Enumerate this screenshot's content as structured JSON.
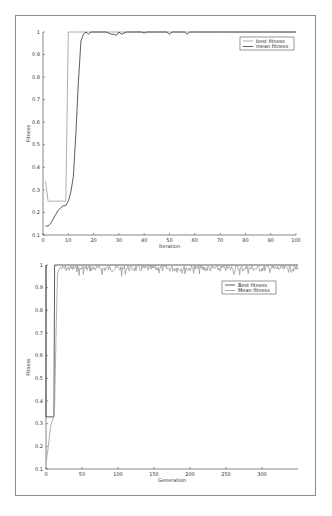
{
  "chart_data": [
    {
      "type": "line",
      "title": "",
      "xlabel": "Iteration",
      "ylabel": "Fitness",
      "xlim": [
        0,
        100
      ],
      "ylim": [
        0.1,
        1
      ],
      "xticks": [
        0,
        10,
        20,
        30,
        40,
        50,
        60,
        70,
        80,
        90,
        100
      ],
      "yticks": [
        0.1,
        0.2,
        0.3,
        0.4,
        0.5,
        0.6,
        0.7,
        0.8,
        0.9,
        1
      ],
      "ytick_labels": [
        "0.1",
        "0.2",
        "0.3",
        "0.4",
        "0.5",
        "0.6",
        "0.7",
        "0.8",
        "0.9",
        "1"
      ],
      "grid": false,
      "legend_position": "upper right",
      "legend": [
        "best fitness",
        "mean fitness"
      ],
      "series": [
        {
          "name": "best fitness",
          "color": "#9a9a9a",
          "x": [
            1,
            2,
            3,
            4,
            5,
            6,
            7,
            8,
            9,
            10,
            11,
            20,
            30,
            40,
            50,
            60,
            70,
            80,
            90,
            100
          ],
          "values": [
            0.34,
            0.25,
            0.25,
            0.25,
            0.25,
            0.25,
            0.25,
            0.25,
            0.25,
            1,
            1,
            1,
            1,
            1,
            1,
            1,
            1,
            1,
            1,
            1
          ]
        },
        {
          "name": "mean fitness",
          "color": "#333333",
          "x": [
            1,
            2,
            3,
            4,
            5,
            6,
            7,
            8,
            9,
            10,
            11,
            12,
            13,
            14,
            15,
            16,
            17,
            18,
            19,
            20,
            25,
            26,
            27,
            28,
            29,
            30,
            31,
            32,
            33,
            34,
            39,
            40,
            41,
            49,
            50,
            51,
            56,
            57,
            58,
            60,
            70,
            80,
            90,
            100
          ],
          "values": [
            0.14,
            0.14,
            0.15,
            0.17,
            0.19,
            0.21,
            0.22,
            0.23,
            0.23,
            0.25,
            0.29,
            0.36,
            0.55,
            0.78,
            0.96,
            0.99,
            1,
            0.99,
            1,
            1,
            1,
            0.995,
            0.99,
            0.99,
            0.985,
            1,
            0.99,
            0.995,
            1,
            1,
            1,
            0.995,
            1,
            1,
            0.99,
            1,
            1,
            0.99,
            1,
            1,
            1,
            1,
            1,
            1
          ]
        }
      ]
    },
    {
      "type": "line",
      "title": "",
      "xlabel": "Generation",
      "ylabel": "Fitness",
      "xlim": [
        0,
        350
      ],
      "ylim": [
        0.1,
        1
      ],
      "xticks": [
        0,
        50,
        100,
        150,
        200,
        250,
        300
      ],
      "yticks": [
        0.1,
        0.2,
        0.3,
        0.4,
        0.5,
        0.6,
        0.7,
        0.8,
        0.9,
        1
      ],
      "ytick_labels": [
        "0.1",
        "0.2",
        "0.3",
        "0.4",
        "0.5",
        "0.6",
        "0.7",
        "0.8",
        "0.9",
        "1"
      ],
      "grid": false,
      "legend_position": "upper right",
      "legend": [
        "Best fitness",
        "Mean fitness"
      ],
      "series": [
        {
          "name": "Best fitness",
          "color": "#333333",
          "x": [
            0,
            0,
            1,
            11,
            12,
            350
          ],
          "values": [
            1,
            0.33,
            0.33,
            0.33,
            1,
            1
          ]
        },
        {
          "name": "Mean fitness",
          "color": "#9a9a9a",
          "x": [
            0,
            2,
            4,
            6,
            8,
            10,
            12,
            14,
            16,
            18,
            20
          ],
          "values": [
            0.13,
            0.17,
            0.22,
            0.28,
            0.31,
            0.32,
            0.38,
            0.7,
            0.96,
            0.98,
            0.99
          ],
          "noise_after": 20,
          "noise_range": [
            0.95,
            1.0
          ],
          "note": "mean fitness oscillates between ~0.97 and 1.0 after generation 20 with occasional dips to ~0.95"
        }
      ]
    }
  ]
}
